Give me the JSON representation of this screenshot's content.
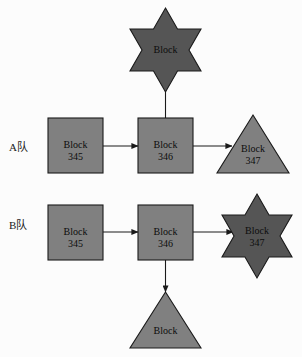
{
  "figure": {
    "background_color": "#fcfcfc",
    "shape_fill_light": "#808080",
    "shape_fill_dark": "#555555",
    "stroke_color": "#1a1a1a",
    "text_color": "#0d0d0d"
  },
  "rows": [
    {
      "id": "row-a",
      "label": "A队",
      "nodes": [
        {
          "id": "a-block-345",
          "shape": "rectangle",
          "fill": "light",
          "line1": "Block",
          "line2": "345"
        },
        {
          "id": "a-block-346",
          "shape": "rectangle",
          "fill": "light",
          "line1": "Block",
          "line2": "346"
        },
        {
          "id": "a-block-347",
          "shape": "triangle",
          "fill": "light",
          "line1": "Block",
          "line2": "347"
        },
        {
          "id": "a-block-star",
          "shape": "star",
          "fill": "dark",
          "line1": "Block",
          "line2": ""
        }
      ],
      "edges": [
        {
          "id": "a-edge-345-346",
          "from": "a-block-345",
          "to": "a-block-346",
          "direction": "right"
        },
        {
          "id": "a-edge-346-347",
          "from": "a-block-346",
          "to": "a-block-347",
          "direction": "right"
        },
        {
          "id": "a-edge-346-star",
          "from": "a-block-346",
          "to": "a-block-star",
          "direction": "up"
        }
      ]
    },
    {
      "id": "row-b",
      "label": "B队",
      "nodes": [
        {
          "id": "b-block-345",
          "shape": "rectangle",
          "fill": "light",
          "line1": "Block",
          "line2": "345"
        },
        {
          "id": "b-block-346",
          "shape": "rectangle",
          "fill": "light",
          "line1": "Block",
          "line2": "346"
        },
        {
          "id": "b-block-347",
          "shape": "star",
          "fill": "dark",
          "line1": "Block",
          "line2": "347"
        },
        {
          "id": "b-block-tri",
          "shape": "triangle",
          "fill": "light",
          "line1": "Block",
          "line2": ""
        }
      ],
      "edges": [
        {
          "id": "b-edge-345-346",
          "from": "b-block-345",
          "to": "b-block-346",
          "direction": "right"
        },
        {
          "id": "b-edge-346-347",
          "from": "b-block-346",
          "to": "b-block-347",
          "direction": "right"
        },
        {
          "id": "b-edge-346-tri",
          "from": "b-block-346",
          "to": "b-block-tri",
          "direction": "down"
        }
      ]
    }
  ]
}
